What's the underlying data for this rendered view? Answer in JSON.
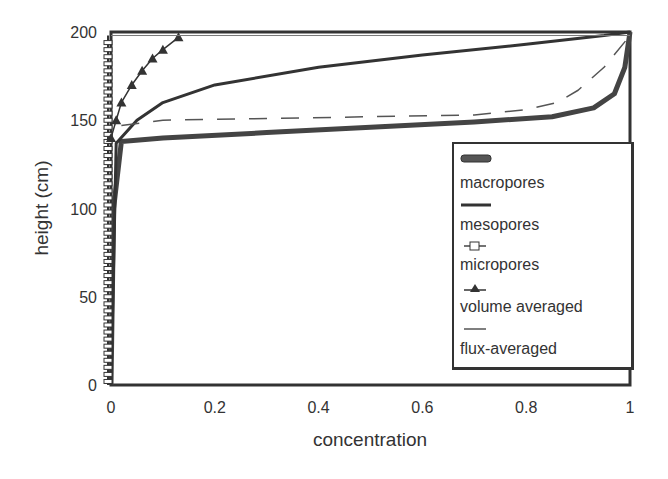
{
  "chart_data": {
    "type": "line",
    "title": "",
    "xlabel": "concentration",
    "ylabel": "height (cm)",
    "xlim": [
      0,
      1
    ],
    "ylim": [
      0,
      200
    ],
    "xticks": [
      "0",
      "0.2",
      "0.4",
      "0.6",
      "0.8",
      "1"
    ],
    "yticks": [
      "0",
      "50",
      "100",
      "150",
      "200"
    ],
    "grid": false,
    "legend_position": "lower right inside",
    "series": [
      {
        "name": "macropores",
        "style": "thick solid",
        "x": [
          0.0,
          0.005,
          0.02,
          0.1,
          0.3,
          0.5,
          0.7,
          0.85,
          0.93,
          0.97,
          0.99,
          1.0
        ],
        "y": [
          0,
          100,
          138,
          140,
          143,
          146,
          149,
          152,
          157,
          165,
          180,
          200
        ]
      },
      {
        "name": "mesopores",
        "style": "solid",
        "x": [
          0.0,
          0.01,
          0.05,
          0.1,
          0.2,
          0.4,
          0.6,
          0.8,
          0.95,
          1.0
        ],
        "y": [
          0,
          137,
          150,
          160,
          170,
          180,
          187,
          193,
          198,
          200
        ]
      },
      {
        "name": "micropores",
        "style": "open squares",
        "x": [
          0.0,
          0.0,
          0.0,
          0.0,
          0.0,
          0.01
        ],
        "y": [
          0,
          50,
          100,
          150,
          190,
          198
        ]
      },
      {
        "name": "volume averaged",
        "style": "triangles",
        "x": [
          0.0,
          0.01,
          0.02,
          0.04,
          0.06,
          0.08,
          0.1,
          0.13
        ],
        "y": [
          140,
          150,
          160,
          170,
          178,
          185,
          190,
          197
        ]
      },
      {
        "name": "flux-averaged",
        "style": "dashed",
        "x": [
          0.02,
          0.1,
          0.3,
          0.5,
          0.7,
          0.8,
          0.86,
          0.9,
          0.95,
          1.0
        ],
        "y": [
          147,
          150,
          151,
          152,
          153,
          156,
          160,
          167,
          180,
          198
        ]
      }
    ]
  },
  "legend": {
    "items": [
      "macropores",
      "mesopores",
      "micropores",
      "volume averaged",
      "flux-averaged"
    ]
  }
}
